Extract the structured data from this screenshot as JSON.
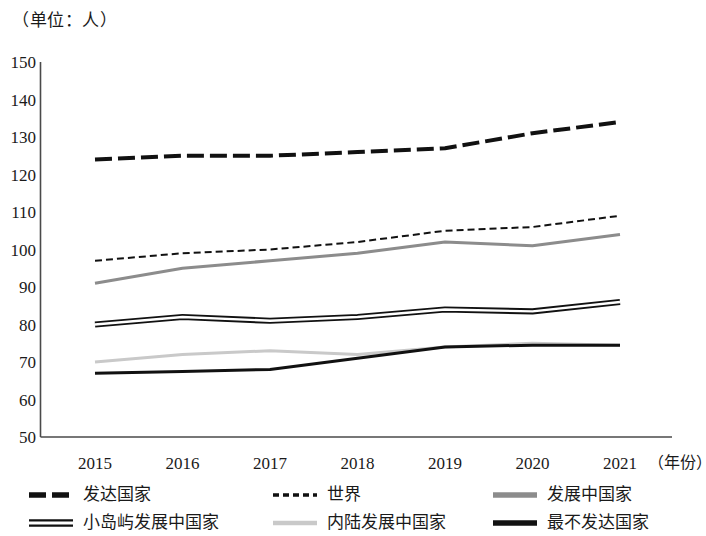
{
  "caption": "（单位：人）",
  "axis": {
    "x_title": "（年份）",
    "y_ticks": [
      "150",
      "140",
      "130",
      "120",
      "110",
      "100",
      "90",
      "80",
      "70",
      "60",
      "50"
    ],
    "x_ticks": [
      "2015",
      "2016",
      "2017",
      "2018",
      "2019",
      "2020",
      "2021"
    ]
  },
  "legend": {
    "items": [
      {
        "label": "发达国家",
        "style": "dashed-thick-black",
        "color": "#111111"
      },
      {
        "label": "世界",
        "style": "dashed-fine-black",
        "color": "#111111"
      },
      {
        "label": "发展中国家",
        "style": "solid-gray",
        "color": "#8c8c8c"
      },
      {
        "label": "小岛屿发展中国家",
        "style": "hollow-outline",
        "color": "#111111"
      },
      {
        "label": "内陆发展中国家",
        "style": "solid-light-gray",
        "color": "#c9c9c9"
      },
      {
        "label": "最不发达国家",
        "style": "solid-black",
        "color": "#111111"
      }
    ]
  },
  "chart_data": {
    "type": "line",
    "title": "",
    "subtitle": "",
    "xlabel": "（年份）",
    "ylabel": "（单位：人）",
    "x": [
      "2015",
      "2016",
      "2017",
      "2018",
      "2019",
      "2020",
      "2021"
    ],
    "categories": [
      "2015",
      "2016",
      "2017",
      "2018",
      "2019",
      "2020",
      "2021"
    ],
    "ylim": [
      50,
      150
    ],
    "ytick_step": 10,
    "grid": false,
    "legend_position": "bottom",
    "series": [
      {
        "name": "发达国家",
        "color": "#111111",
        "line_style": "dashed",
        "line_width": 4,
        "values": [
          124,
          125,
          125,
          126,
          127,
          131,
          134
        ]
      },
      {
        "name": "世界",
        "color": "#111111",
        "line_style": "dashed-fine",
        "line_width": 2,
        "values": [
          97,
          99,
          100,
          102,
          105,
          106,
          109
        ]
      },
      {
        "name": "发展中国家",
        "color": "#8c8c8c",
        "line_style": "solid",
        "line_width": 3,
        "values": [
          91,
          95,
          97,
          99,
          102,
          101,
          104
        ]
      },
      {
        "name": "小岛屿发展中国家",
        "color": "#ffffff",
        "line_style": "hollow",
        "line_width": 4,
        "values": [
          80,
          82,
          81,
          82,
          84,
          83.5,
          86
        ]
      },
      {
        "name": "内陆发展中国家",
        "color": "#c9c9c9",
        "line_style": "solid",
        "line_width": 3,
        "values": [
          70,
          72,
          73,
          72,
          74,
          75,
          74.5
        ]
      },
      {
        "name": "最不发达国家",
        "color": "#111111",
        "line_style": "solid",
        "line_width": 3,
        "values": [
          67,
          67.5,
          68,
          71,
          74,
          74.5,
          74.5
        ]
      }
    ]
  }
}
